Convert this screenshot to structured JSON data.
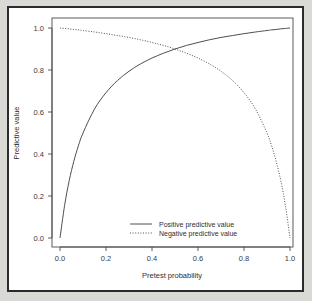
{
  "figure": {
    "background_color": "#d9d9d6",
    "panel_color": "#ffffff",
    "frame_color": "#2b2b2b",
    "line_color": "#3b3b3b"
  },
  "chart_data": {
    "type": "line",
    "title": "",
    "subtitle": "",
    "xlabel": "Pretest probability",
    "ylabel": "Predictive value",
    "xlim": [
      0.0,
      1.0
    ],
    "ylim": [
      0.0,
      1.0
    ],
    "grid": false,
    "legend_position": "bottom-center",
    "xticks": [
      "0.0",
      "0.2",
      "0.4",
      "0.6",
      "0.8",
      "1.0"
    ],
    "xtick_values": [
      0.0,
      0.2,
      0.4,
      0.6,
      0.8,
      1.0
    ],
    "yticks": [
      "0.0",
      "0.2",
      "0.4",
      "0.6",
      "0.8",
      "1.0"
    ],
    "ytick_values": [
      0.0,
      0.2,
      0.4,
      0.6,
      0.8,
      1.0
    ],
    "x": [
      0.0,
      0.02,
      0.04,
      0.06,
      0.08,
      0.1,
      0.15,
      0.2,
      0.25,
      0.3,
      0.35,
      0.4,
      0.45,
      0.5,
      0.55,
      0.6,
      0.65,
      0.7,
      0.75,
      0.8,
      0.85,
      0.9,
      0.92,
      0.94,
      0.96,
      0.98,
      1.0
    ],
    "series": [
      {
        "name": "Positive predictive value",
        "style": "solid",
        "values": [
          0.0,
          0.155,
          0.273,
          0.365,
          0.439,
          0.5,
          0.614,
          0.692,
          0.75,
          0.794,
          0.829,
          0.857,
          0.88,
          0.9,
          0.917,
          0.931,
          0.944,
          0.955,
          0.964,
          0.973,
          0.981,
          0.988,
          0.991,
          0.993,
          0.996,
          0.998,
          1.0
        ]
      },
      {
        "name": "Negative predictive value",
        "style": "dotted",
        "values": [
          1.0,
          0.998,
          0.996,
          0.993,
          0.991,
          0.988,
          0.981,
          0.973,
          0.964,
          0.955,
          0.944,
          0.931,
          0.917,
          0.9,
          0.88,
          0.857,
          0.829,
          0.794,
          0.75,
          0.692,
          0.614,
          0.5,
          0.439,
          0.365,
          0.273,
          0.155,
          0.0
        ]
      }
    ],
    "legend": [
      {
        "label": "Positive predictive value",
        "style": "solid"
      },
      {
        "label": "Negative predictive value",
        "style": "dotted"
      }
    ]
  }
}
